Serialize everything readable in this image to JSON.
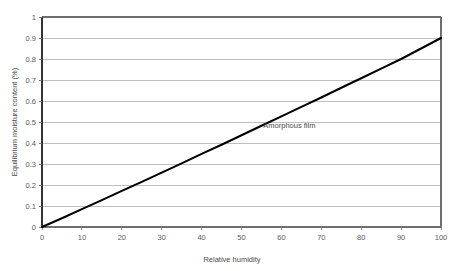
{
  "chart_data": {
    "type": "line",
    "title": "",
    "subtitle": "",
    "xlabel": "Relative humidity",
    "ylabel": "Equilibrium moisture content (%)",
    "xlim": [
      0,
      100
    ],
    "ylim": [
      0,
      1
    ],
    "grid": "horizontal",
    "legend": "none",
    "annotations": [
      {
        "text": "Amorphous film",
        "x": 62,
        "y": 0.47
      }
    ],
    "xticks": [
      0,
      10,
      20,
      30,
      40,
      50,
      60,
      70,
      80,
      90,
      100
    ],
    "xtick_labels": [
      "0",
      "10",
      "20",
      "30",
      "40",
      "50",
      "60",
      "70",
      "80",
      "90",
      "100"
    ],
    "yticks": [
      0,
      0.1,
      0.2,
      0.3,
      0.4,
      0.5,
      0.6,
      0.7,
      0.8,
      0.9,
      1
    ],
    "ytick_labels": [
      "0",
      "0.1",
      "0.2",
      "0.3",
      "0.4",
      "0.5",
      "0.6",
      "0.7",
      "0.8",
      "0.9",
      "1"
    ],
    "series": [
      {
        "name": "Amorphous film",
        "color": "#000000",
        "x": [
          0,
          5,
          10,
          15,
          20,
          25,
          30,
          35,
          40,
          45,
          50,
          55,
          60,
          65,
          70,
          75,
          80,
          85,
          90,
          95,
          100
        ],
        "values": [
          0,
          0.042,
          0.085,
          0.128,
          0.172,
          0.215,
          0.259,
          0.303,
          0.348,
          0.392,
          0.437,
          0.482,
          0.527,
          0.572,
          0.617,
          0.663,
          0.708,
          0.754,
          0.8,
          0.85,
          0.9
        ]
      }
    ],
    "colors": {
      "line": "#000000",
      "gridline": "#b8b8b8",
      "axis": "#555555",
      "plot_background": "#ffffff",
      "text": "#5a5a5a"
    }
  }
}
